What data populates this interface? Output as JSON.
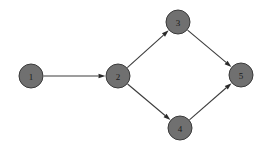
{
  "figure": {
    "background_color": "#ffffff",
    "width": 270,
    "height": 151
  },
  "style": {
    "node_fill": "#707070",
    "node_stroke": "#3a3a3a",
    "node_radius": 12,
    "label_color": "#1a1a1a",
    "edge_color": "#3c3c3c",
    "edge_width": 1.1,
    "arrow_color": "#2a2a2a",
    "arrow_length": 7,
    "arrow_width": 4.6
  },
  "chart_data": {
    "type": "diagram",
    "diagram_kind": "directed-graph",
    "nodes": [
      {
        "id": "1",
        "label": "1",
        "x": 31,
        "y": 76
      },
      {
        "id": "2",
        "label": "2",
        "x": 118,
        "y": 76
      },
      {
        "id": "3",
        "label": "3",
        "x": 178,
        "y": 22
      },
      {
        "id": "4",
        "label": "4",
        "x": 180,
        "y": 128
      },
      {
        "id": "5",
        "label": "5",
        "x": 241,
        "y": 75
      }
    ],
    "edges": [
      {
        "id": "e1",
        "from": "1",
        "to": "2",
        "directed": true
      },
      {
        "id": "e2",
        "from": "2",
        "to": "3",
        "directed": true
      },
      {
        "id": "e3",
        "from": "2",
        "to": "4",
        "directed": true
      },
      {
        "id": "e4",
        "from": "3",
        "to": "5",
        "directed": true
      },
      {
        "id": "e5",
        "from": "4",
        "to": "5",
        "directed": true
      }
    ]
  }
}
